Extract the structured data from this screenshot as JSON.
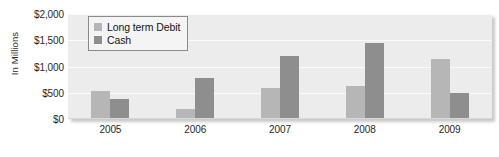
{
  "chart_data": {
    "type": "bar",
    "title": "",
    "xlabel": "",
    "ylabel": "In Millions",
    "categories": [
      "2005",
      "2006",
      "2007",
      "2008",
      "2009"
    ],
    "series": [
      {
        "name": "Long term Debit",
        "color": "#b6b6b6",
        "values": [
          530,
          200,
          590,
          620,
          1150
        ]
      },
      {
        "name": "Cash",
        "color": "#8e8e8e",
        "values": [
          380,
          780,
          1200,
          1450,
          500
        ]
      }
    ],
    "ylim": [
      0,
      2000
    ],
    "yticks": [
      0,
      500,
      1000,
      1500,
      2000
    ],
    "ytick_labels": [
      "$0",
      "$500",
      "$1,000",
      "$1,500",
      "$2,000"
    ],
    "grid": true,
    "legend_position": "top-left",
    "plot_background": "#ececec",
    "gridline_color": "#fbfbfb"
  }
}
